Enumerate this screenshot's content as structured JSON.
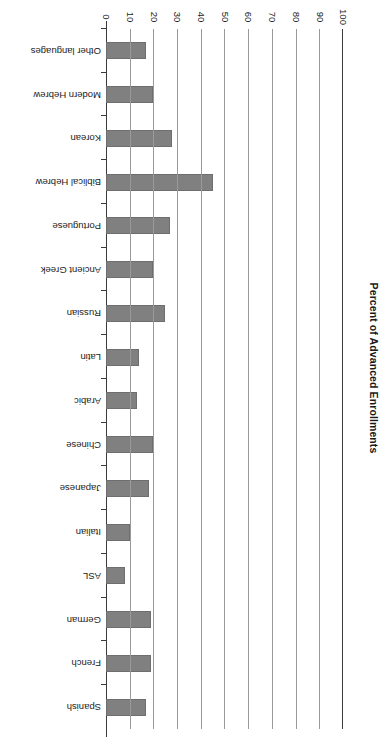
{
  "chart_data": {
    "type": "bar",
    "orientation": "horizontal",
    "title": "",
    "xlabel": "Percent of Advanced Enrollments",
    "ylabel": "",
    "xlim": [
      0,
      100
    ],
    "grid": true,
    "legend": "none",
    "bar_color": "#808080",
    "axis_color": "#3b3b3b",
    "gridline_color": "#9a9a9a",
    "tick_labels": [
      "0",
      "10",
      "20",
      "30",
      "40",
      "50",
      "60",
      "70",
      "80",
      "90",
      "100"
    ],
    "tick_values": [
      0,
      10,
      20,
      30,
      40,
      50,
      60,
      70,
      80,
      90,
      100
    ],
    "categories": [
      "Spanish",
      "French",
      "German",
      "ASL",
      "Italian",
      "Japanese",
      "Chinese",
      "Arabic",
      "Latin",
      "Russian",
      "Ancient Greek",
      "Portuguese",
      "Biblical Hebrew",
      "Korean",
      "Modern Hebrew",
      "Other languages"
    ],
    "values": [
      17,
      19,
      19,
      8,
      10,
      18,
      20,
      13,
      14,
      25,
      20,
      27,
      45,
      28,
      20,
      17
    ]
  }
}
